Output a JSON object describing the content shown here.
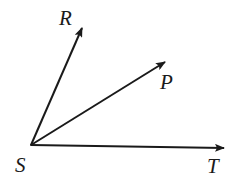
{
  "diagram": {
    "type": "angle-rays",
    "vertex": {
      "label": "S",
      "x": 31,
      "y": 145
    },
    "rays": [
      {
        "label": "R",
        "tip": {
          "x": 84,
          "y": 24
        }
      },
      {
        "label": "P",
        "tip": {
          "x": 168,
          "y": 60
        }
      },
      {
        "label": "T",
        "tip": {
          "x": 227,
          "y": 148
        }
      }
    ],
    "labels": {
      "S": "S",
      "R": "R",
      "P": "P",
      "T": "T"
    },
    "stroke_color": "#1a1a1a",
    "background_color": "#ffffff"
  }
}
